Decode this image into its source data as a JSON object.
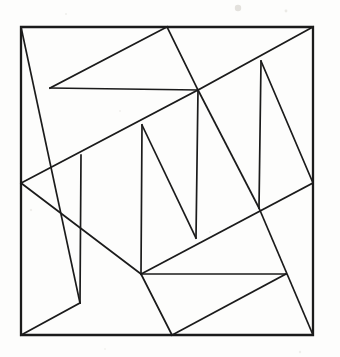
{
  "figure": {
    "kind": "geometric-line-diagram",
    "background_color": "#fdfdfc",
    "line_color": "#1b1b1b",
    "border_stroke_width": 2.3,
    "line_stroke_width": 1.7,
    "canvas": {
      "width": 340,
      "height": 357
    },
    "square": {
      "label": "outer-square",
      "corners": {
        "top_left": [
          21,
          27
        ],
        "top_right": [
          313,
          27
        ],
        "bottom_right": [
          313,
          335
        ],
        "bottom_left": [
          21,
          335
        ]
      },
      "path": "M21,27 L313,27 L313,335 L21,335 Z"
    },
    "vertices": [
      {
        "name": "top-left-corner",
        "x": 21,
        "y": 27
      },
      {
        "name": "top-right-corner",
        "x": 313,
        "y": 27
      },
      {
        "name": "bottom-right-corner",
        "x": 313,
        "y": 335
      },
      {
        "name": "bottom-left-corner",
        "x": 21,
        "y": 335
      },
      {
        "name": "top-edge-node",
        "x": 167,
        "y": 27
      },
      {
        "name": "upper-left-node",
        "x": 50,
        "y": 88
      },
      {
        "name": "upper-center-node",
        "x": 198,
        "y": 90
      },
      {
        "name": "right-upper-node",
        "x": 261,
        "y": 61
      },
      {
        "name": "left-edge-node",
        "x": 21,
        "y": 183
      },
      {
        "name": "mid-left-node",
        "x": 81,
        "y": 155
      },
      {
        "name": "center-vertical-top",
        "x": 142,
        "y": 125
      },
      {
        "name": "right-edge-node",
        "x": 313,
        "y": 183
      },
      {
        "name": "right-center-node",
        "x": 259,
        "y": 208
      },
      {
        "name": "center-vertical-bottom",
        "x": 196,
        "y": 238
      },
      {
        "name": "lower-center-node",
        "x": 141,
        "y": 274
      },
      {
        "name": "lower-left-node",
        "x": 80,
        "y": 303
      },
      {
        "name": "lower-right-node",
        "x": 286,
        "y": 274
      },
      {
        "name": "bottom-edge-node",
        "x": 172,
        "y": 335
      }
    ],
    "segments": [
      {
        "name": "segment-top-left-to-lower-left",
        "x1": 21,
        "y1": 27,
        "x2": 80,
        "y2": 303
      },
      {
        "name": "segment-upper-left-to-top-edge",
        "x1": 50,
        "y1": 88,
        "x2": 167,
        "y2": 27
      },
      {
        "name": "segment-upper-left-horizontal",
        "x1": 50,
        "y1": 88,
        "x2": 198,
        "y2": 90
      },
      {
        "name": "segment-top-edge-to-upper-center",
        "x1": 167,
        "y1": 27,
        "x2": 198,
        "y2": 90
      },
      {
        "name": "segment-upper-center-to-top-right",
        "x1": 198,
        "y1": 90,
        "x2": 313,
        "y2": 27
      },
      {
        "name": "segment-right-upper-vertical",
        "x1": 261,
        "y1": 61,
        "x2": 259,
        "y2": 208
      },
      {
        "name": "segment-right-upper-to-right-edge",
        "x1": 261,
        "y1": 61,
        "x2": 313,
        "y2": 183
      },
      {
        "name": "segment-upper-center-to-left-edge",
        "x1": 198,
        "y1": 90,
        "x2": 21,
        "y2": 183
      },
      {
        "name": "segment-mid-left-to-lower-left-vertical",
        "x1": 81,
        "y1": 155,
        "x2": 80,
        "y2": 303
      },
      {
        "name": "segment-left-edge-to-lower-center",
        "x1": 21,
        "y1": 183,
        "x2": 141,
        "y2": 274
      },
      {
        "name": "segment-center-vertical",
        "x1": 142,
        "y1": 125,
        "x2": 141,
        "y2": 274
      },
      {
        "name": "segment-center-top-to-center-bottom",
        "x1": 142,
        "y1": 125,
        "x2": 196,
        "y2": 238
      },
      {
        "name": "segment-upper-center-to-center-bottom",
        "x1": 198,
        "y1": 90,
        "x2": 196,
        "y2": 238
      },
      {
        "name": "segment-upper-center-to-right-center",
        "x1": 198,
        "y1": 90,
        "x2": 259,
        "y2": 208
      },
      {
        "name": "segment-right-edge-to-lower-center",
        "x1": 313,
        "y1": 183,
        "x2": 141,
        "y2": 274
      },
      {
        "name": "segment-lower-horizontal",
        "x1": 141,
        "y1": 274,
        "x2": 286,
        "y2": 274
      },
      {
        "name": "segment-right-center-to-bottom-right",
        "x1": 259,
        "y1": 208,
        "x2": 313,
        "y2": 335
      },
      {
        "name": "segment-lower-right-to-bottom-edge",
        "x1": 286,
        "y1": 274,
        "x2": 172,
        "y2": 335
      },
      {
        "name": "segment-lower-center-to-bottom-edge",
        "x1": 141,
        "y1": 274,
        "x2": 172,
        "y2": 335
      },
      {
        "name": "segment-lower-left-to-bottom-left",
        "x1": 80,
        "y1": 303,
        "x2": 21,
        "y2": 335
      }
    ],
    "specks": [
      {
        "x": 238,
        "y": 8,
        "r": 3.2,
        "o": 0.5
      },
      {
        "x": 286,
        "y": 11,
        "r": 1.4,
        "o": 0.35
      },
      {
        "x": 66,
        "y": 14,
        "r": 1.1,
        "o": 0.25
      },
      {
        "x": 120,
        "y": 111,
        "r": 1.0,
        "o": 0.22
      },
      {
        "x": 31,
        "y": 210,
        "r": 1.2,
        "o": 0.24
      },
      {
        "x": 210,
        "y": 232,
        "r": 1.0,
        "o": 0.2
      },
      {
        "x": 300,
        "y": 352,
        "r": 1.2,
        "o": 0.25
      },
      {
        "x": 105,
        "y": 349,
        "r": 1.0,
        "o": 0.2
      }
    ]
  }
}
